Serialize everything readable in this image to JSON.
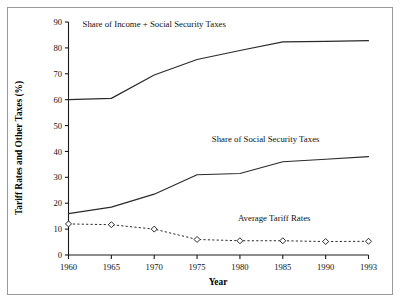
{
  "chart_data": {
    "type": "line",
    "title": "",
    "xlabel": "Year",
    "ylabel": "Tariff Rates and Other Taxes (%)",
    "categories": [
      "1960",
      "1965",
      "1970",
      "1975",
      "1980",
      "1985",
      "1990",
      "1993"
    ],
    "x": [
      1960,
      1965,
      1970,
      1975,
      1980,
      1985,
      1990,
      1993
    ],
    "ylim": [
      0,
      90
    ],
    "yticks": [
      0,
      10,
      20,
      30,
      40,
      50,
      60,
      70,
      80,
      90
    ],
    "grid": false,
    "legend": "inline annotations",
    "series": [
      {
        "name": "Share of Income + Social Security Taxes",
        "style": "solid",
        "markers": false,
        "values": [
          60.0,
          60.5,
          69.5,
          75.5,
          79.0,
          82.3,
          82.5,
          82.8
        ],
        "annotation": "Share of Income + Social Security Taxes",
        "annotation_x": 1970,
        "annotation_y": 88.0
      },
      {
        "name": "Share of Social Security Taxes",
        "style": "solid",
        "markers": false,
        "values": [
          16.0,
          18.5,
          23.5,
          31.0,
          31.5,
          36.0,
          37.0,
          38.0
        ],
        "annotation": "Share of Social Security Taxes",
        "annotation_x": 1983,
        "annotation_y": 43.5
      },
      {
        "name": "Average Tariff Rates",
        "style": "dashed",
        "markers": true,
        "marker_shape": "diamond",
        "values": [
          12.0,
          11.7,
          10.0,
          6.0,
          5.5,
          5.5,
          5.2,
          5.3
        ],
        "annotation": "Average Tariff Rates",
        "annotation_x": 1984,
        "annotation_y": 13.0
      }
    ],
    "colors": {
      "line": "#2a2a2a",
      "axis": "#1a1a1a",
      "text": "#111111",
      "background": "#ffffff",
      "frame": "#9a9a9a"
    }
  }
}
